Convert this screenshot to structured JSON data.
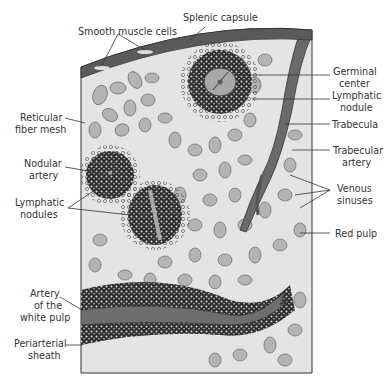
{
  "diagram": {
    "colors": {
      "background": "#ffffff",
      "tissue": "#e4e4e4",
      "capsule": "#5a5a5a",
      "artery": "#6e6e6e",
      "cells": "#b4b4b4",
      "germinal_center": "#a8a8a8",
      "text": "#333333"
    },
    "labels": {
      "splenic_capsule": "Splenic capsule",
      "smooth_muscle_cells": "Smooth muscle cells",
      "germinal_center_1": "Germinal",
      "germinal_center_2": "center",
      "lymphatic_nodule_1": "Lymphatic",
      "lymphatic_nodule_2": "nodule",
      "trabecula": "Trabecula",
      "trabecular_artery_1": "Trabecular",
      "trabecular_artery_2": "artery",
      "venous_sinuses_1": "Venous",
      "venous_sinuses_2": "sinuses",
      "red_pulp": "Red pulp",
      "reticular_fiber_mesh_1": "Reticular",
      "reticular_fiber_mesh_2": "fiber mesh",
      "nodular_artery_1": "Nodular",
      "nodular_artery_2": "artery",
      "lymphatic_nodules_1": "Lymphatic",
      "lymphatic_nodules_2": "nodules",
      "artery_white_pulp_1": "Artery",
      "artery_white_pulp_2": "of the",
      "artery_white_pulp_3": "white pulp",
      "periarterial_sheath_1": "Periarterial",
      "periarterial_sheath_2": "sheath"
    }
  }
}
